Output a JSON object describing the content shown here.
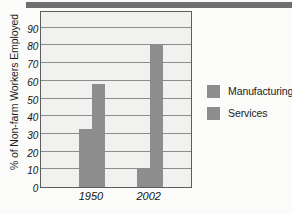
{
  "figure": {
    "top_band_present": true,
    "background_color": "#fbfbfa",
    "plot_background_color": "#f1f1ef",
    "frame_color": "#5d5d5d",
    "grid_color": "#8c8c8c",
    "bar_color": "#8d8d8d"
  },
  "chart_data": {
    "type": "bar",
    "title": "",
    "xlabel": "",
    "ylabel": "% of Non-farm Workers Employed",
    "categories": [
      "1950",
      "2002"
    ],
    "series": [
      {
        "name": "Manufacturing",
        "values": [
          33,
          11
        ],
        "color": "#8d8d8d"
      },
      {
        "name": "Services",
        "values": [
          58,
          81
        ],
        "color": "#8d8d8d"
      }
    ],
    "ylim": [
      0,
      100
    ],
    "yticks": [
      0,
      10,
      20,
      30,
      40,
      50,
      60,
      70,
      80,
      90
    ],
    "ytick_labels": [
      "0",
      "10",
      "20",
      "30",
      "40",
      "50",
      "60",
      "70",
      "80",
      "90"
    ],
    "gridlines": [
      10,
      20,
      30,
      40,
      50,
      60,
      70,
      80,
      90,
      100
    ],
    "grid": true,
    "legend_position": "right",
    "legend_entries": [
      "Manufacturing",
      "Services"
    ]
  }
}
